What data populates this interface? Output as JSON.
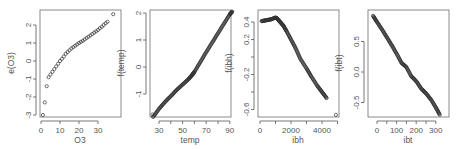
{
  "chart_data": [
    {
      "type": "scatter",
      "title": "",
      "xlabel": "O3",
      "ylabel": "e(O3)",
      "xticks": [
        0,
        10,
        20,
        30
      ],
      "yticks": [
        -3,
        -2,
        -1,
        0,
        1,
        2
      ],
      "xlim": [
        0,
        38
      ],
      "ylim": [
        -3.1,
        2.7
      ],
      "grid": false,
      "points": [
        [
          1,
          -3.0
        ],
        [
          2,
          -2.3
        ],
        [
          3,
          -1.4
        ],
        [
          4,
          -0.9
        ],
        [
          5,
          -0.75
        ],
        [
          6,
          -0.6
        ],
        [
          7,
          -0.45
        ],
        [
          8,
          -0.3
        ],
        [
          9,
          -0.15
        ],
        [
          10,
          0.0
        ],
        [
          11,
          0.12
        ],
        [
          12,
          0.25
        ],
        [
          13,
          0.4
        ],
        [
          14,
          0.5
        ],
        [
          15,
          0.6
        ],
        [
          16,
          0.7
        ],
        [
          17,
          0.77
        ],
        [
          18,
          0.85
        ],
        [
          19,
          0.92
        ],
        [
          20,
          1.0
        ],
        [
          21,
          1.06
        ],
        [
          22,
          1.12
        ],
        [
          23,
          1.2
        ],
        [
          24,
          1.28
        ],
        [
          25,
          1.35
        ],
        [
          26,
          1.42
        ],
        [
          27,
          1.5
        ],
        [
          28,
          1.58
        ],
        [
          29,
          1.65
        ],
        [
          30,
          1.72
        ],
        [
          31,
          1.82
        ],
        [
          32,
          1.9
        ],
        [
          33,
          2.0
        ],
        [
          34,
          2.1
        ],
        [
          35,
          2.18
        ],
        [
          38,
          2.6
        ]
      ]
    },
    {
      "type": "scatter",
      "title": "",
      "xlabel": "temp",
      "ylabel": "f(temp)",
      "xticks": [
        30,
        40,
        50,
        60,
        70,
        80,
        90
      ],
      "xticklabels": [
        "30",
        "",
        "50",
        "",
        "70",
        "",
        "90"
      ],
      "yticks": [
        -1,
        0,
        1,
        2
      ],
      "xlim": [
        25,
        93
      ],
      "ylim": [
        -1.95,
        2.1
      ],
      "grid": false,
      "curve": [
        [
          25,
          -1.85
        ],
        [
          30,
          -1.55
        ],
        [
          35,
          -1.3
        ],
        [
          40,
          -1.08
        ],
        [
          45,
          -0.85
        ],
        [
          50,
          -0.65
        ],
        [
          55,
          -0.45
        ],
        [
          58,
          -0.3
        ],
        [
          60,
          -0.18
        ],
        [
          65,
          0.18
        ],
        [
          70,
          0.55
        ],
        [
          75,
          0.9
        ],
        [
          80,
          1.25
        ],
        [
          85,
          1.6
        ],
        [
          90,
          1.95
        ],
        [
          92,
          2.05
        ]
      ]
    },
    {
      "type": "scatter",
      "title": "",
      "xlabel": "ibh",
      "ylabel": "f(ibh)",
      "xticks": [
        0,
        1000,
        2000,
        3000,
        4000,
        5000
      ],
      "xticklabels": [
        "0",
        "",
        "2000",
        "",
        "4000",
        ""
      ],
      "yticks": [
        -0.6,
        -0.4,
        -0.2,
        0.0,
        0.2,
        0.4
      ],
      "yticklabels": [
        "-0.6",
        "",
        "-0.2",
        "",
        "0.2",
        "0.4"
      ],
      "xlim": [
        0,
        5000
      ],
      "ylim": [
        -0.7,
        0.46
      ],
      "grid": false,
      "curve": [
        [
          100,
          0.41
        ],
        [
          400,
          0.42
        ],
        [
          700,
          0.43
        ],
        [
          1000,
          0.45
        ],
        [
          1100,
          0.44
        ],
        [
          1300,
          0.4
        ],
        [
          1500,
          0.36
        ],
        [
          1700,
          0.3
        ],
        [
          2000,
          0.2
        ],
        [
          2300,
          0.1
        ],
        [
          2600,
          -0.02
        ],
        [
          3000,
          -0.13
        ],
        [
          3300,
          -0.22
        ],
        [
          3700,
          -0.33
        ],
        [
          4000,
          -0.4
        ],
        [
          4300,
          -0.47
        ]
      ],
      "outlier": [
        4900,
        -0.66
      ]
    },
    {
      "type": "scatter",
      "title": "",
      "xlabel": "ibt",
      "ylabel": "f(ibt)",
      "xticks": [
        0,
        50,
        100,
        150,
        200,
        250,
        300
      ],
      "xticklabels": [
        "0",
        "",
        "100",
        "",
        "200",
        "",
        "300"
      ],
      "yticks": [
        -0.5,
        0.0,
        0.5
      ],
      "yticklabels": [
        "-0.5",
        "0.0",
        "0.5"
      ],
      "xlim": [
        -30,
        335
      ],
      "ylim": [
        -0.75,
        0.95
      ],
      "grid": false,
      "curve": [
        [
          -20,
          0.92
        ],
        [
          0,
          0.82
        ],
        [
          25,
          0.7
        ],
        [
          50,
          0.57
        ],
        [
          75,
          0.44
        ],
        [
          100,
          0.3
        ],
        [
          125,
          0.15
        ],
        [
          150,
          0.08
        ],
        [
          175,
          -0.07
        ],
        [
          200,
          -0.15
        ],
        [
          225,
          -0.27
        ],
        [
          250,
          -0.35
        ],
        [
          275,
          -0.45
        ],
        [
          300,
          -0.58
        ],
        [
          320,
          -0.7
        ]
      ]
    }
  ],
  "panels": [
    {
      "xlabel": "O3",
      "ylabel": "e(O3)",
      "xticks": [
        "0",
        "10",
        "20",
        "30"
      ],
      "yticks": [
        "-3",
        "-2",
        "-1",
        "0",
        "1",
        "2"
      ]
    },
    {
      "xlabel": "temp",
      "ylabel": "f(temp)",
      "xticks": [
        "30",
        "50",
        "70",
        "90"
      ],
      "yticks": [
        "-1",
        "0",
        "1",
        "2"
      ]
    },
    {
      "xlabel": "ibh",
      "ylabel": "f(ibh)",
      "xticks": [
        "0",
        "2000",
        "4000"
      ],
      "yticks": [
        "-0.6",
        "-0.2",
        "0.2",
        "0.4"
      ]
    },
    {
      "xlabel": "ibt",
      "ylabel": "f(ibt)",
      "xticks": [
        "0",
        "100",
        "200",
        "300"
      ],
      "yticks": [
        "-0.5",
        "0.0",
        "0.5"
      ]
    }
  ]
}
